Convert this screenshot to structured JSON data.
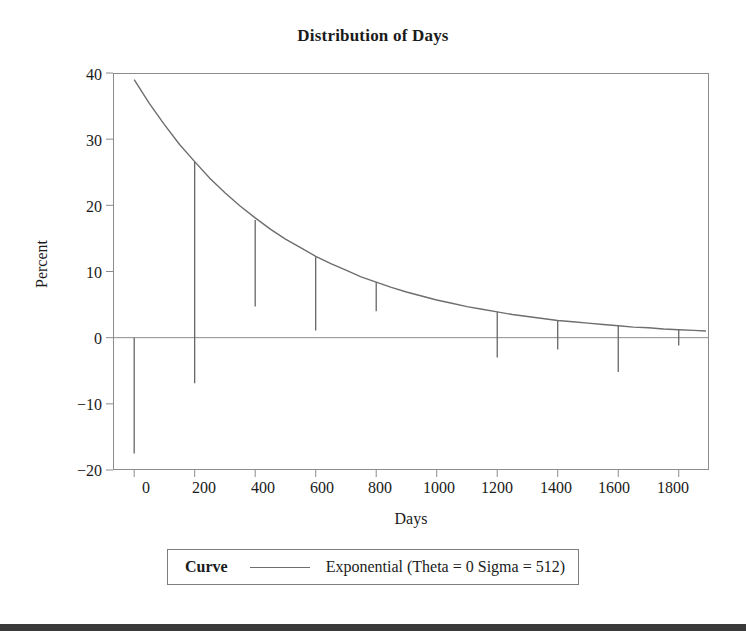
{
  "figure": {
    "title": "Distribution of Days",
    "background_color": "#ffffff",
    "axis_color": "#8c8c8c",
    "curve_color": "#6e6e6e",
    "needle_color": "#5a5a5a",
    "text_color": "#1b1b1b"
  },
  "legend": {
    "title": "Curve",
    "entry": "Exponential (Theta = 0 Sigma = 512)"
  },
  "chart_data": {
    "type": "line",
    "title": "Distribution of Days",
    "xlabel": "Days",
    "ylabel": "Percent",
    "xlim": [
      -70,
      1900
    ],
    "ylim": [
      -20,
      40
    ],
    "xticks": [
      0,
      200,
      400,
      600,
      800,
      1000,
      1200,
      1400,
      1600,
      1800
    ],
    "xtick_labels": [
      "0",
      "200",
      "400",
      "600",
      "800",
      "1000",
      "1200",
      "1400",
      "1600",
      "1800"
    ],
    "yticks": [
      -20,
      -10,
      0,
      10,
      20,
      30,
      40
    ],
    "ytick_labels": [
      "−20",
      "−10",
      "0",
      "10",
      "20",
      "30",
      "40"
    ],
    "grid": false,
    "zero_line": true,
    "legend_position": "below-axes",
    "series": [
      {
        "name": "Exponential (Theta = 0 Sigma = 512)",
        "type": "line",
        "color": "#6e6e6e",
        "x": [
          0,
          50,
          100,
          150,
          200,
          250,
          300,
          350,
          400,
          450,
          500,
          550,
          600,
          650,
          700,
          750,
          800,
          850,
          900,
          950,
          1000,
          1050,
          1100,
          1150,
          1200,
          1250,
          1300,
          1350,
          1400,
          1450,
          1500,
          1550,
          1600,
          1650,
          1700,
          1750,
          1800,
          1850,
          1890
        ],
        "y": [
          39.0,
          35.4,
          32.2,
          29.2,
          26.6,
          24.1,
          21.9,
          19.9,
          18.1,
          16.4,
          14.9,
          13.6,
          12.3,
          11.2,
          10.2,
          9.2,
          8.4,
          7.6,
          6.9,
          6.3,
          5.7,
          5.2,
          4.7,
          4.3,
          3.9,
          3.5,
          3.2,
          2.9,
          2.6,
          2.4,
          2.2,
          2.0,
          1.8,
          1.6,
          1.5,
          1.3,
          1.2,
          1.1,
          1.0
        ]
      },
      {
        "name": "needles",
        "type": "needle",
        "color": "#5a5a5a",
        "comment": "vertical segments drawn from a top value down to a bottom value at each bin center",
        "x": [
          0,
          200,
          400,
          600,
          800,
          1200,
          1400,
          1600,
          1800
        ],
        "top": [
          0.0,
          26.6,
          17.8,
          12.3,
          8.4,
          3.9,
          2.6,
          1.8,
          1.2
        ],
        "bottom": [
          -17.5,
          -6.9,
          4.7,
          1.1,
          4.0,
          -3.0,
          -1.8,
          -5.2,
          -1.2
        ]
      }
    ]
  }
}
